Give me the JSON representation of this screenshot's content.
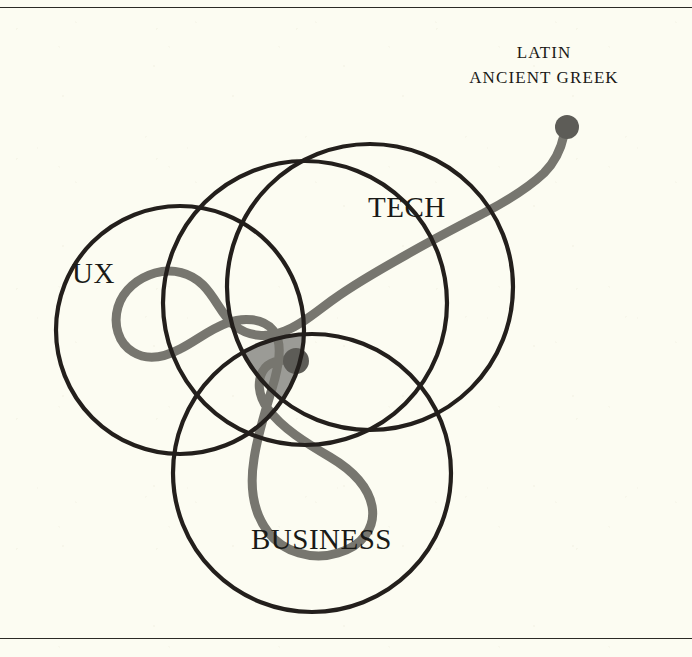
{
  "figure": {
    "type": "venn-diagram",
    "background_color": "#fcfcf2",
    "rules": {
      "stroke_color": "#2b2a26"
    },
    "circles": [
      {
        "name": "ux",
        "label": "UX",
        "cx": 180,
        "cy": 330,
        "r": 124,
        "stroke": "#231f1c"
      },
      {
        "name": "tech",
        "label": "TECH",
        "cx": 370,
        "cy": 287,
        "r": 143,
        "stroke": "#231f1c"
      },
      {
        "name": "business",
        "label": "BUSINESS",
        "cx": 312,
        "cy": 473,
        "r": 139,
        "stroke": "#231f1c"
      },
      {
        "name": "middle",
        "label": "",
        "cx": 305,
        "cy": 303,
        "r": 142,
        "stroke": "#231f1c"
      }
    ],
    "intersection": {
      "name": "core-overlap",
      "fill": "#9b9b96",
      "description": "shaded central region where all circles overlap"
    },
    "path": {
      "name": "journey-path",
      "stroke": "#77766f",
      "start_marker": "dot",
      "end_marker": "dot",
      "start_point": [
        296,
        361
      ],
      "end_point": [
        567,
        127
      ]
    },
    "annotation": {
      "lines": [
        "LATIN",
        "ANCIENT GREEK"
      ]
    }
  }
}
